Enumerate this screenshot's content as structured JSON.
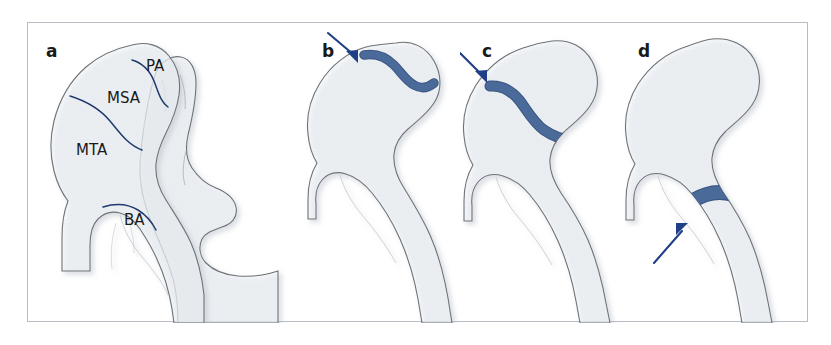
{
  "figure": {
    "type": "anatomical-diagram",
    "panel_count": 4
  },
  "panels": [
    {
      "key": "a",
      "label": "a",
      "caption": "",
      "description": "Proximal femur with acetabulum/pelvis, divided into four anatomical zones by thin navy boundary curves",
      "zones": [
        {
          "abbr": "PA",
          "name": "proximal area"
        },
        {
          "abbr": "MSA",
          "name": "medial subcapital area"
        },
        {
          "abbr": "MTA",
          "name": "medial transcervical area"
        },
        {
          "abbr": "BA",
          "name": "basal area"
        }
      ],
      "arrow": false
    },
    {
      "key": "b",
      "label": "b",
      "description": "Subcapital fracture line highlighted just below the femoral head",
      "fracture_level": "subcapital",
      "arrow": true,
      "arrow_direction": "down-right"
    },
    {
      "key": "c",
      "label": "c",
      "description": "Transcervical fracture line highlighted across the femoral neck",
      "fracture_level": "transcervical",
      "arrow": true,
      "arrow_direction": "down-right"
    },
    {
      "key": "d",
      "label": "d",
      "description": "Basicervical fracture line highlighted at the base of the femoral neck",
      "fracture_level": "basicervical",
      "arrow": true,
      "arrow_direction": "up-right"
    }
  ],
  "colors": {
    "frame_border": "#b9bcc2",
    "page_background": "#ffffff",
    "bone_fill": "#f3f5f8",
    "bone_outline": "#6e7277",
    "bone_shadow": "#c9ced6",
    "fracture_band": "#4a6a9a",
    "fracture_band_outline": "#3b5680",
    "zone_divider": "#1f3a6e",
    "arrow": "#1f3f86",
    "label_text": "#1a1a1a"
  },
  "icons": {
    "arrow": "arrow-pointer-icon"
  }
}
